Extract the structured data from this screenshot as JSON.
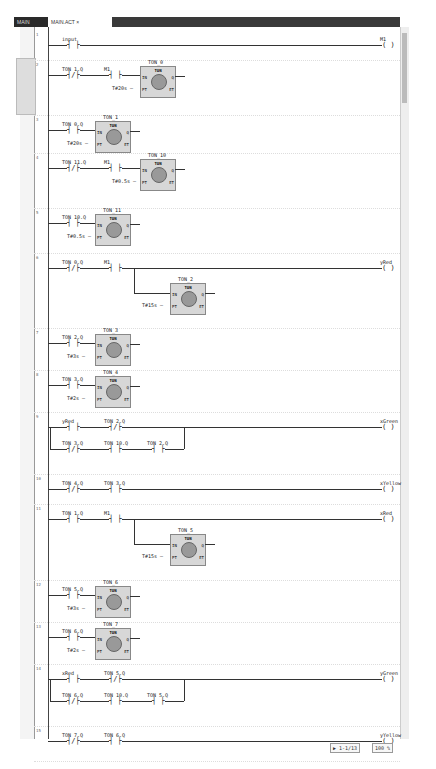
{
  "tabs": [
    {
      "label": "MAIN"
    },
    {
      "label": "MAIN.ACT  ×"
    }
  ],
  "status": {
    "cursor": "▶ 1-1/13",
    "zoom": "100 %"
  },
  "rungs": [
    {
      "n": "1",
      "h": 30,
      "contacts": [
        {
          "x": 70,
          "name": "input",
          "type": "NO"
        }
      ],
      "coil": {
        "name": "M1"
      }
    },
    {
      "n": "2",
      "h": 55,
      "contacts": [
        {
          "x": 70,
          "name": "TON_1.Q",
          "type": "NC"
        },
        {
          "x": 112,
          "name": "M1",
          "type": "NO"
        }
      ],
      "fb": {
        "x": 140,
        "name": "TON_0",
        "pt": "T#20s"
      }
    },
    {
      "n": "3",
      "h": 38,
      "contacts": [
        {
          "x": 70,
          "name": "TON_0.Q",
          "type": "NO"
        }
      ],
      "fb": {
        "x": 95,
        "name": "TON_1",
        "pt": "T#20s"
      }
    },
    {
      "n": "4",
      "h": 55,
      "contacts": [
        {
          "x": 70,
          "name": "TON_11.Q",
          "type": "NC"
        },
        {
          "x": 112,
          "name": "M1",
          "type": "NO"
        }
      ],
      "fb": {
        "x": 140,
        "name": "TON_10",
        "pt": "T#0.5s"
      }
    },
    {
      "n": "5",
      "h": 45,
      "contacts": [
        {
          "x": 70,
          "name": "TON_10.Q",
          "type": "NO"
        }
      ],
      "fb": {
        "x": 95,
        "name": "TON_11",
        "pt": "T#0.5s"
      }
    },
    {
      "n": "6",
      "h": 75,
      "contacts": [
        {
          "x": 70,
          "name": "TON_0.Q",
          "type": "NC"
        },
        {
          "x": 112,
          "name": "M1",
          "type": "NO"
        }
      ],
      "coil": {
        "name": "yRed"
      },
      "fb": {
        "x": 170,
        "name": "TON_2",
        "pt": "T#15s",
        "branch": true
      }
    },
    {
      "n": "7",
      "h": 42,
      "contacts": [
        {
          "x": 70,
          "name": "TON_2.Q",
          "type": "NO"
        }
      ],
      "fb": {
        "x": 95,
        "name": "TON_3",
        "pt": "T#3s"
      }
    },
    {
      "n": "8",
      "h": 42,
      "contacts": [
        {
          "x": 70,
          "name": "TON_3.Q",
          "type": "NO"
        }
      ],
      "fb": {
        "x": 95,
        "name": "TON_4",
        "pt": "T#2s"
      }
    },
    {
      "n": "9",
      "h": 62,
      "contacts": [
        {
          "x": 70,
          "name": "yRed",
          "type": "NO"
        },
        {
          "x": 112,
          "name": "TON_2.Q",
          "type": "NC"
        }
      ],
      "coil": {
        "name": "xGreen"
      },
      "par": [
        {
          "x": 70,
          "name": "TON_3.Q",
          "type": "NC"
        },
        {
          "x": 112,
          "name": "TON_10.Q",
          "type": "NO"
        },
        {
          "x": 155,
          "name": "TON_2.Q",
          "type": "NO"
        }
      ]
    },
    {
      "n": "10",
      "h": 30,
      "contacts": [
        {
          "x": 70,
          "name": "TON_4.Q",
          "type": "NC"
        },
        {
          "x": 112,
          "name": "TON_3.Q",
          "type": "NO"
        }
      ],
      "coil": {
        "name": "xYellow"
      }
    },
    {
      "n": "11",
      "h": 76,
      "contacts": [
        {
          "x": 70,
          "name": "TON_1.Q",
          "type": "NO"
        },
        {
          "x": 112,
          "name": "M1",
          "type": "NO"
        }
      ],
      "coil": {
        "name": "xRed"
      },
      "fb": {
        "x": 170,
        "name": "TON_5",
        "pt": "T#15s",
        "branch": true
      }
    },
    {
      "n": "12",
      "h": 42,
      "contacts": [
        {
          "x": 70,
          "name": "TON_5.Q",
          "type": "NO"
        }
      ],
      "fb": {
        "x": 95,
        "name": "TON_6",
        "pt": "T#3s"
      }
    },
    {
      "n": "13",
      "h": 42,
      "contacts": [
        {
          "x": 70,
          "name": "TON_6.Q",
          "type": "NO"
        }
      ],
      "fb": {
        "x": 95,
        "name": "TON_7",
        "pt": "T#2s"
      }
    },
    {
      "n": "14",
      "h": 62,
      "contacts": [
        {
          "x": 70,
          "name": "xRed",
          "type": "NO"
        },
        {
          "x": 112,
          "name": "TON_5.Q",
          "type": "NC"
        }
      ],
      "coil": {
        "name": "yGreen"
      },
      "par": [
        {
          "x": 70,
          "name": "TON_6.Q",
          "type": "NC"
        },
        {
          "x": 112,
          "name": "TON_10.Q",
          "type": "NO"
        },
        {
          "x": 155,
          "name": "TON_5.Q",
          "type": "NO"
        }
      ]
    },
    {
      "n": "15",
      "h": 35,
      "contacts": [
        {
          "x": 70,
          "name": "TON_7.Q",
          "type": "NC"
        },
        {
          "x": 112,
          "name": "TON_6.Q",
          "type": "NO"
        }
      ],
      "coil": {
        "name": "yYellow"
      }
    }
  ],
  "fb_type": "TON",
  "pins": {
    "in": "IN",
    "pt": "PT",
    "q": "Q",
    "et": "ET"
  }
}
